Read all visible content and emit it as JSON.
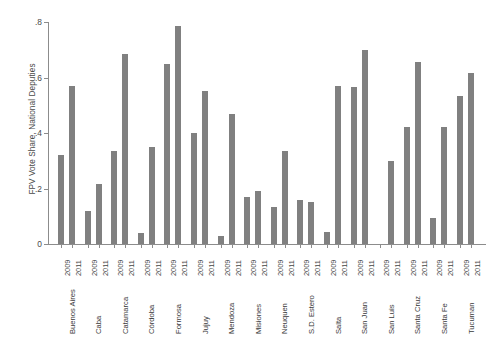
{
  "chart_data": {
    "type": "bar",
    "title": "",
    "xlabel": "",
    "ylabel": "FPV Vote Share, National Deputies",
    "ylim": [
      0,
      0.8
    ],
    "yticks": [
      0,
      0.2,
      0.4,
      0.6,
      0.8
    ],
    "ytick_labels": [
      "0",
      ".2",
      ".4",
      ".6",
      ".8"
    ],
    "grid": false,
    "legend": "none",
    "bar_color": "#808080",
    "axis_color": "#8c8c8c",
    "categories": [
      "Buenos Aires",
      "Caba",
      "Catamarca",
      "Córdoba",
      "Formosa",
      "Jujuy",
      "Mendoza",
      "Misiones",
      "Neuquen",
      "S.D. Estero",
      "Salta",
      "San Juan",
      "San Luis",
      "Santa Cruz",
      "Santa Fe",
      "Tucuman"
    ],
    "group_tick_labels": [
      "2009",
      "2011"
    ],
    "series": [
      {
        "name": "2009",
        "values": [
          0.32,
          0.12,
          0.335,
          0.04,
          0.65,
          0.4,
          0.03,
          0.17,
          0.135,
          0.16,
          0.045,
          0.565,
          0.0,
          0.42,
          0.095,
          0.535
        ]
      },
      {
        "name": "2011",
        "values": [
          0.57,
          0.215,
          0.685,
          0.35,
          0.785,
          0.55,
          0.47,
          0.19,
          0.335,
          0.15,
          0.57,
          0.7,
          0.3,
          0.655,
          0.42,
          0.615
        ]
      }
    ]
  }
}
